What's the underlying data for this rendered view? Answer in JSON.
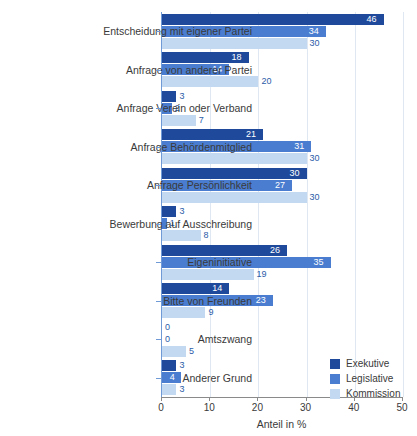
{
  "chart_data": {
    "type": "bar",
    "orientation": "horizontal",
    "title": "",
    "xlabel": "Anteil in %",
    "ylabel": "",
    "xlim": [
      0,
      50
    ],
    "xticks": [
      0,
      10,
      20,
      30,
      40,
      50
    ],
    "xtick_labels": [
      "0",
      "10",
      "20",
      "30",
      "40",
      "50"
    ],
    "grid": "vertical",
    "legend_position": "bottom-right",
    "categories": [
      "Entscheidung mit eigener Partei",
      "Anfrage von anderer Partei",
      "Anfrage Verein oder Verband",
      "Anfrage Behördenmitglied",
      "Anfrage Persönlichkeit",
      "Bewerbung auf Ausschreibung",
      "Eigeninitiative",
      "Bitte von Freunden",
      "Amtszwang",
      "Anderer Grund"
    ],
    "series": [
      {
        "name": "Exekutive",
        "color": "#1f4a9b",
        "values": [
          46,
          18,
          3,
          21,
          30,
          3,
          26,
          14,
          0,
          3
        ]
      },
      {
        "name": "Legislative",
        "color": "#4a7dd0",
        "values": [
          34,
          14,
          2,
          31,
          27,
          1,
          35,
          23,
          0,
          4
        ]
      },
      {
        "name": "Kommission",
        "color": "#c3d9f2",
        "values": [
          30,
          20,
          7,
          30,
          30,
          8,
          19,
          9,
          5,
          3
        ]
      }
    ]
  },
  "colors": {
    "series_dark": "#1f4a9b",
    "series_mid": "#4a7dd0",
    "series_light": "#c3d9f2",
    "grid": "#dfe7f2",
    "axis": "#8a8a8a",
    "label_inside": "#ffffff",
    "label_outside": "#2c5ca8",
    "text": "#3a3a3a"
  }
}
